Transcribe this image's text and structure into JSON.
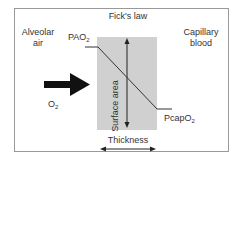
{
  "diagram": {
    "title": "Fick's law",
    "left_label_line1": "Alveolar",
    "left_label_line2": "air",
    "right_label_line1": "Capillary",
    "right_label_line2": "blood",
    "pao2_base": "PAO",
    "pao2_sub": "2",
    "pcapo2_base": "PcapO",
    "pcapo2_sub": "2",
    "o2_base": "O",
    "o2_sub": "2",
    "surface_area_label": "Surface area",
    "thickness_label": "Thickness",
    "colors": {
      "membrane": "#d0d0d0",
      "line": "#333333",
      "arrow": "#111111",
      "border": "#999999"
    }
  }
}
